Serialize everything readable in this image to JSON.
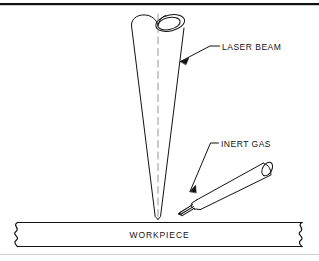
{
  "figure": {
    "name": "laser-beam-welding-diagram",
    "background_color": "#ffffff",
    "line_color": "#111111",
    "border": {
      "top_rule_color": "#111111",
      "bottom_rule_color": "#cfcfcf"
    }
  },
  "labels": {
    "laser_beam": "LASER BEAM",
    "inert_gas": "INERT GAS",
    "workpiece": "WORKPIECE"
  },
  "parts": {
    "laser_beam_cone": {
      "name": "laser-beam-cone",
      "description": "converging conical laser beam with elliptical tube mouth at top, focusing to a point on the workpiece surface",
      "apex": [
        158,
        219
      ],
      "top_left": [
        131,
        24
      ],
      "top_right": [
        184,
        24
      ]
    },
    "centerline": {
      "name": "beam-centerline",
      "style": "dashed",
      "from": [
        158,
        14
      ],
      "to": [
        158,
        219
      ]
    },
    "inert_gas_nozzle": {
      "name": "inert-gas-nozzle",
      "description": "tapered cylindrical nozzle angled down-left toward the beam focus, with elliptical opening at the rear and gas flow lines at the tip",
      "tip": [
        183,
        212
      ],
      "rear": [
        272,
        166
      ]
    },
    "workpiece_bar": {
      "name": "workpiece-bar",
      "description": "horizontal plate with zigzag break symbols at both ends",
      "top": 222,
      "bottom": 247,
      "left": 13,
      "right": 306
    }
  },
  "leaders": [
    {
      "name": "leader-laser-beam",
      "target_label": "LASER BEAM",
      "arrow_from": [
        213,
        47
      ],
      "arrow_to": [
        178,
        63
      ]
    },
    {
      "name": "leader-inert-gas",
      "target_label": "INERT GAS",
      "arrow_from": [
        212,
        146
      ],
      "arrow_to": [
        188,
        193
      ]
    }
  ]
}
